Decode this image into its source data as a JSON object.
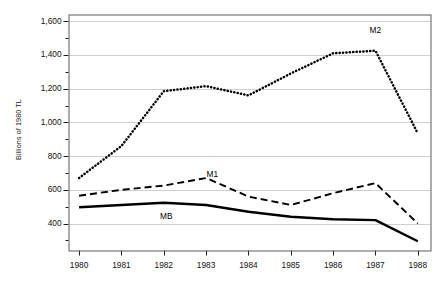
{
  "chart_data": {
    "type": "line",
    "title": "",
    "xlabel": "",
    "ylabel": "Billions of 1980 TL",
    "x": [
      1980,
      1981,
      1982,
      1983,
      1984,
      1985,
      1986,
      1987,
      1988
    ],
    "xtick_labels": [
      "1980",
      "1981",
      "1982",
      "1983",
      "1984",
      "1985",
      "1986",
      "1987",
      "1988"
    ],
    "ytick_labels": [
      "1,600",
      "1,400",
      "1,200",
      "1,000",
      "800",
      "600",
      "400"
    ],
    "ytick_values": [
      1600,
      1400,
      1200,
      1000,
      800,
      600,
      400
    ],
    "ylim": [
      240,
      1640
    ],
    "xlim": [
      1979.75,
      1988.3
    ],
    "grid": "horizontal",
    "minor_ticks": true,
    "legend_position": "inline-annotations",
    "series": [
      {
        "name": "M2",
        "label": "M2",
        "style": "dotted",
        "color": "#000000",
        "values": [
          670,
          860,
          1185,
          1215,
          1160,
          1290,
          1410,
          1425,
          935
        ],
        "label_position": {
          "x": 1987.05,
          "y": 1540
        }
      },
      {
        "name": "M1",
        "label": "M1",
        "style": "dashed",
        "color": "#000000",
        "values": [
          565,
          600,
          625,
          670,
          560,
          510,
          580,
          640,
          400
        ],
        "label_position": {
          "x": 1983.2,
          "y": 690
        }
      },
      {
        "name": "MB",
        "label": "MB",
        "style": "solid",
        "color": "#000000",
        "values": [
          497,
          510,
          523,
          510,
          470,
          440,
          425,
          420,
          295
        ],
        "label_position": {
          "x": 1982.1,
          "y": 440
        }
      }
    ]
  },
  "axes": {
    "y_axis_title": "Billions of 1980 TL"
  }
}
